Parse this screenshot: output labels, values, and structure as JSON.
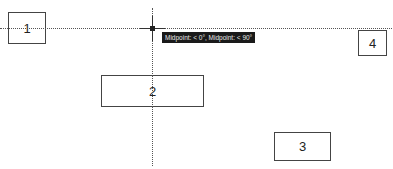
{
  "canvas": {
    "shapes": [
      {
        "id": "1",
        "label": "1"
      },
      {
        "id": "2",
        "label": "2"
      },
      {
        "id": "3",
        "label": "3"
      },
      {
        "id": "4",
        "label": "4"
      }
    ],
    "snap_tooltip": "Midpoint: < 0°, Midpoint: < 90°",
    "colors": {
      "stroke": "#444444",
      "tooltip_bg": "#1a1a1a",
      "tooltip_text": "#e8e8e8",
      "background": "#ffffff"
    }
  }
}
